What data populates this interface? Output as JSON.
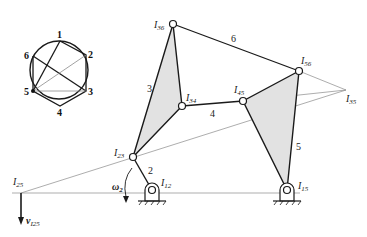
{
  "diagram": {
    "type": "instant-center mechanism diagram",
    "colors": {
      "link": "#1a1a1a",
      "construction": "#8a8a8a",
      "fill": "#e2e2e2",
      "background": "#ffffff"
    },
    "circle_graph": {
      "nodes": [
        {
          "id": "1",
          "label": "1"
        },
        {
          "id": "2",
          "label": "2"
        },
        {
          "id": "3",
          "label": "3"
        },
        {
          "id": "4",
          "label": "4"
        },
        {
          "id": "5",
          "label": "5"
        },
        {
          "id": "6",
          "label": "6"
        }
      ]
    },
    "links": {
      "l2": "2",
      "l3": "3",
      "l4": "4",
      "l5": "5",
      "l6": "6"
    },
    "centers": {
      "I36": {
        "main": "I",
        "sub": "36"
      },
      "I56": {
        "main": "I",
        "sub": "56"
      },
      "I34": {
        "main": "I",
        "sub": "34"
      },
      "I45": {
        "main": "I",
        "sub": "45"
      },
      "I35": {
        "main": "I",
        "sub": "35"
      },
      "I23": {
        "main": "I",
        "sub": "23"
      },
      "I25": {
        "main": "I",
        "sub": "25"
      },
      "I12": {
        "main": "I",
        "sub": "12"
      },
      "I15": {
        "main": "I",
        "sub": "15"
      }
    },
    "omega": {
      "main": "ω",
      "sub": "2"
    },
    "velocity": {
      "main": "v",
      "sub": "I25"
    }
  }
}
